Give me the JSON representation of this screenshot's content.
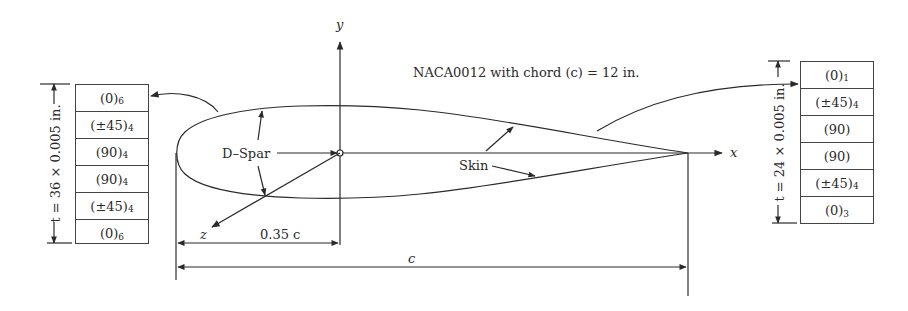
{
  "figure": {
    "title": "NACA0012 with chord (c) = 12 in.",
    "axes": {
      "x": "x",
      "y": "y",
      "z": "z"
    },
    "labels": {
      "dspar": "D–Spar",
      "skin": "Skin"
    },
    "dimensions": {
      "spar_location": "0.35 c",
      "chord": "c"
    }
  },
  "dspar_laminate": {
    "thickness_label": "t = 36 × 0.005 in.",
    "plies": [
      {
        "angle": "(0)",
        "count": "6"
      },
      {
        "angle": "(±45)",
        "count": "4"
      },
      {
        "angle": "(90)",
        "count": "4"
      },
      {
        "angle": "(90)",
        "count": "4"
      },
      {
        "angle": "(±45)",
        "count": "4"
      },
      {
        "angle": "(0)",
        "count": "6"
      }
    ]
  },
  "skin_laminate": {
    "thickness_label": "t = 24 × 0.005 in.",
    "plies": [
      {
        "angle": "(0)",
        "count": "1"
      },
      {
        "angle": "(±45)",
        "count": "4"
      },
      {
        "angle": "(90)",
        "count": ""
      },
      {
        "angle": "(90)",
        "count": ""
      },
      {
        "angle": "(±45)",
        "count": "4"
      },
      {
        "angle": "(0)",
        "count": "3"
      }
    ]
  },
  "colors": {
    "ink": "#2a2a2a",
    "background": "#ffffff"
  }
}
